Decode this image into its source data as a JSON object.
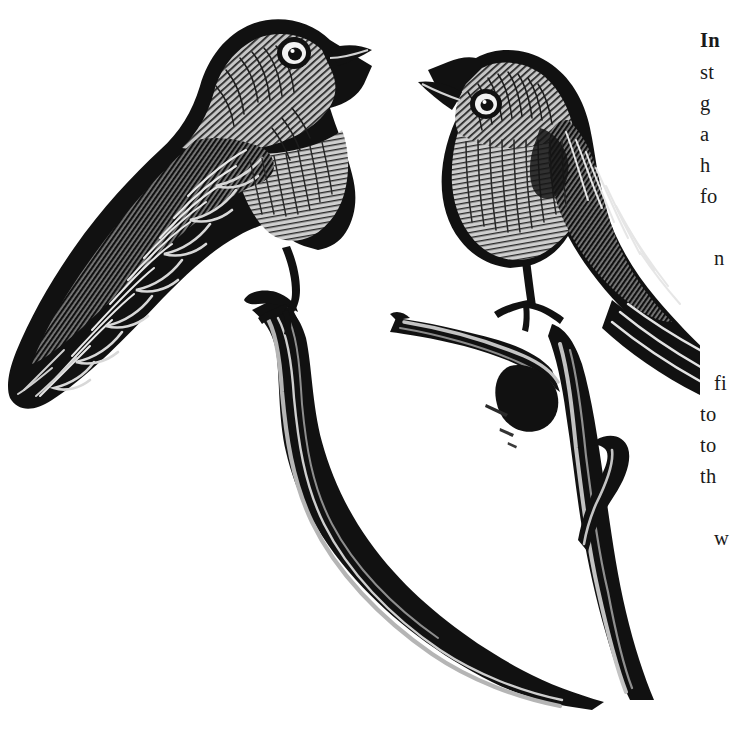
{
  "page": {
    "kind": "scanned-book-page",
    "background_color": "#ffffff",
    "width": 749,
    "height": 748
  },
  "illustration": {
    "name": "two-birds-on-branch-engraving",
    "style": "woodcut-engraving",
    "ink_color": "#111111",
    "midtone_color": "#8c8c8c",
    "highlight_color": "#c9c9c9",
    "paper_color": "#ffffff",
    "subjects": [
      {
        "name": "left-bird",
        "pose": "perched-facing-right-head-up",
        "parts": [
          "head",
          "eye",
          "beak",
          "wing",
          "breast",
          "tail",
          "leg",
          "foot"
        ]
      },
      {
        "name": "right-bird",
        "pose": "perched-facing-left-upright",
        "parts": [
          "head",
          "eye",
          "beak",
          "wing",
          "breast",
          "tail",
          "leg",
          "foot"
        ]
      },
      {
        "name": "forked-branch",
        "pose": "y-shaped-diagonal",
        "parts": [
          "main-stem",
          "left-limb",
          "right-limb",
          "short-spur"
        ]
      }
    ]
  },
  "text_column": {
    "note": "right-hand body text cropped by page edge; only first characters of each line are visible",
    "font_size_px": 20.5,
    "lines": [
      {
        "text": "In",
        "top": 30,
        "bold": true,
        "indent": false
      },
      {
        "text": "st",
        "top": 62,
        "bold": false,
        "indent": false
      },
      {
        "text": "g",
        "top": 93,
        "bold": false,
        "indent": false
      },
      {
        "text": "a",
        "top": 124,
        "bold": false,
        "indent": false
      },
      {
        "text": "h",
        "top": 155,
        "bold": false,
        "indent": false
      },
      {
        "text": "fo",
        "top": 186,
        "bold": false,
        "indent": false
      },
      {
        "text": "n",
        "top": 248,
        "bold": false,
        "indent": true
      },
      {
        "text": "fi",
        "top": 373,
        "bold": false,
        "indent": true
      },
      {
        "text": "to",
        "top": 404,
        "bold": false,
        "indent": false
      },
      {
        "text": "to",
        "top": 435,
        "bold": false,
        "indent": false
      },
      {
        "text": "th",
        "top": 466,
        "bold": false,
        "indent": false
      },
      {
        "text": "w",
        "top": 528,
        "bold": false,
        "indent": true
      }
    ]
  }
}
